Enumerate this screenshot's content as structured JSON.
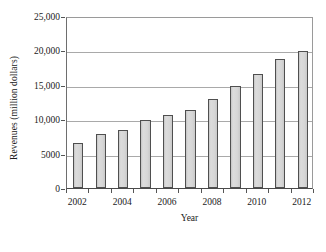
{
  "chart_data": {
    "type": "bar",
    "title": "",
    "subtitle": "",
    "xlabel": "Year",
    "ylabel": "Revenues (million dollars)",
    "categories": [
      "2002",
      "2003",
      "2004",
      "2005",
      "2006",
      "2007",
      "2008",
      "2009",
      "2010",
      "2011",
      "2012"
    ],
    "values": [
      6600,
      7900,
      8500,
      9900,
      10600,
      11400,
      12900,
      14900,
      16600,
      18800,
      19900
    ],
    "series": [
      {
        "name": "Revenues",
        "values": [
          6600,
          7900,
          8500,
          9900,
          10600,
          11400,
          12900,
          14900,
          16600,
          18800,
          19900
        ]
      }
    ],
    "ylim": [
      0,
      25000
    ],
    "ytick_values": [
      0,
      5000,
      10000,
      15000,
      20000,
      25000
    ],
    "ytick_labels": [
      "0",
      "5000",
      "10,000",
      "15,000",
      "20,000",
      "25,000"
    ],
    "xtick_labels": [
      "2002",
      "2004",
      "2006",
      "2008",
      "2010",
      "2012"
    ],
    "xtick_categories": [
      "2002",
      "2004",
      "2006",
      "2008",
      "2010",
      "2012"
    ],
    "grid": true,
    "grid_axis": "y",
    "legend": false,
    "legend_position": "none",
    "bar_fill_color": "#d6d6d6",
    "bar_edge_color": "#4f4f4f",
    "gridline_color": "#a9a9a9",
    "axis_color": "#4a4a4a",
    "background_color": "#ffffff",
    "annotations": []
  }
}
